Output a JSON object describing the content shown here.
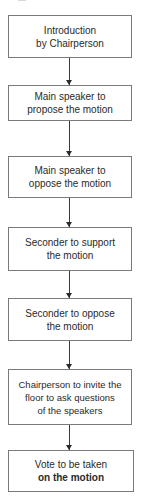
{
  "diagram": {
    "type": "flowchart",
    "direction": "top-to-bottom",
    "colors": {
      "border": "#7a7a7a",
      "arrow": "#2a2a2a",
      "text": "#2a2a2a",
      "background": "#ffffff"
    },
    "steps": [
      {
        "lines": [
          "Introduction",
          "by Chairperson"
        ]
      },
      {
        "lines": [
          "Main speaker to",
          "propose the motion"
        ]
      },
      {
        "lines": [
          "Main speaker to",
          "oppose the motion"
        ]
      },
      {
        "lines": [
          "Seconder to support",
          "the motion"
        ]
      },
      {
        "lines": [
          "Seconder to oppose",
          "the motion"
        ]
      },
      {
        "lines": [
          "Chairperson to invite the",
          "floor to ask questions",
          "of the speakers"
        ]
      },
      {
        "lines": [
          "Vote to be taken",
          "on the motion"
        ]
      }
    ]
  }
}
